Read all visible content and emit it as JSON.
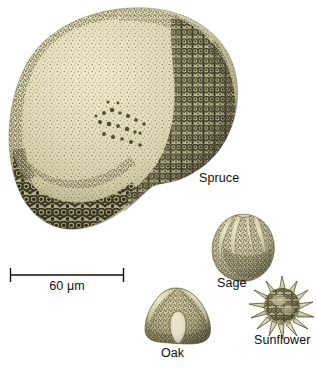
{
  "figure": {
    "type": "scientific-illustration",
    "background_color": "#ffffff",
    "width": 317,
    "height": 368
  },
  "scale_bar": {
    "label": "60 μm",
    "value": 60,
    "unit": "μm",
    "x_start": 10,
    "x_end": 124,
    "y": 275,
    "color": "#111111"
  },
  "specimens": [
    {
      "id": "spruce",
      "label": "Spruce",
      "texture": "reticulate-and-stippled",
      "fill_color": "#e5dfc0",
      "shade_color": "#9a946a",
      "dark_color": "#4b4630",
      "label_x": 199,
      "label_y": 172
    },
    {
      "id": "sage",
      "label": "Sage",
      "texture": "lobed-punctate",
      "fill_color": "#d9d3b2",
      "shade_color": "#938d63",
      "dark_color": "#4a452e",
      "label_x": 217,
      "label_y": 277
    },
    {
      "id": "oak",
      "label": "Oak",
      "texture": "triangular-scabrate",
      "fill_color": "#cfc9a4",
      "shade_color": "#8b855c",
      "dark_color": "#474228",
      "label_x": 161,
      "label_y": 347
    },
    {
      "id": "sunflower",
      "label": "Sunflower",
      "texture": "echinate-spiny",
      "fill_color": "#ded7b4",
      "shade_color": "#96905f",
      "dark_color": "#4c4729",
      "label_x": 254,
      "label_y": 334
    }
  ]
}
